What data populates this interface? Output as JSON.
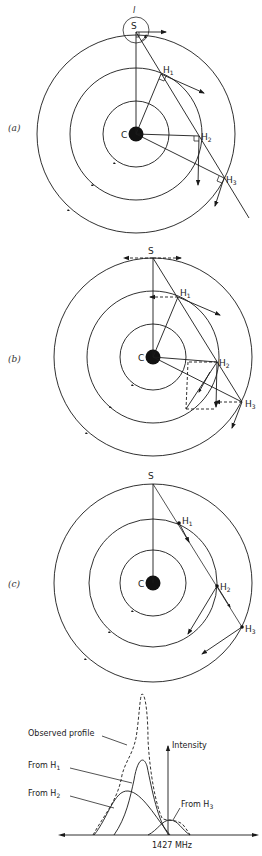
{
  "figure": {
    "panels": [
      {
        "id": "a",
        "label": "(a)",
        "center_label": "C",
        "sun_label": "S",
        "sun_marker": "l",
        "clouds": [
          {
            "label": "H",
            "sub": "1"
          },
          {
            "label": "H",
            "sub": "2"
          },
          {
            "label": "H",
            "sub": "3"
          }
        ]
      },
      {
        "id": "b",
        "label": "(b)",
        "center_label": "C",
        "sun_label": "S",
        "clouds": [
          {
            "label": "H",
            "sub": "1"
          },
          {
            "label": "H",
            "sub": "2"
          },
          {
            "label": "H",
            "sub": "3"
          }
        ]
      },
      {
        "id": "c",
        "label": "(c)",
        "center_label": "C",
        "sun_label": "S",
        "clouds": [
          {
            "label": "H",
            "sub": "1"
          },
          {
            "label": "H",
            "sub": "2"
          },
          {
            "label": "H",
            "sub": "3"
          }
        ]
      }
    ],
    "spectrum": {
      "observed_label": "Observed profile",
      "from_h1_label": "From H",
      "from_h1_sub": "1",
      "from_h2_label": "From H",
      "from_h2_sub": "2",
      "from_h3_label": "From H",
      "from_h3_sub": "3",
      "y_axis_label": "Intensity",
      "x_tick_label": "1427 MHz"
    },
    "colors": {
      "ink": "#1a1a1a",
      "background": "#ffffff"
    }
  }
}
